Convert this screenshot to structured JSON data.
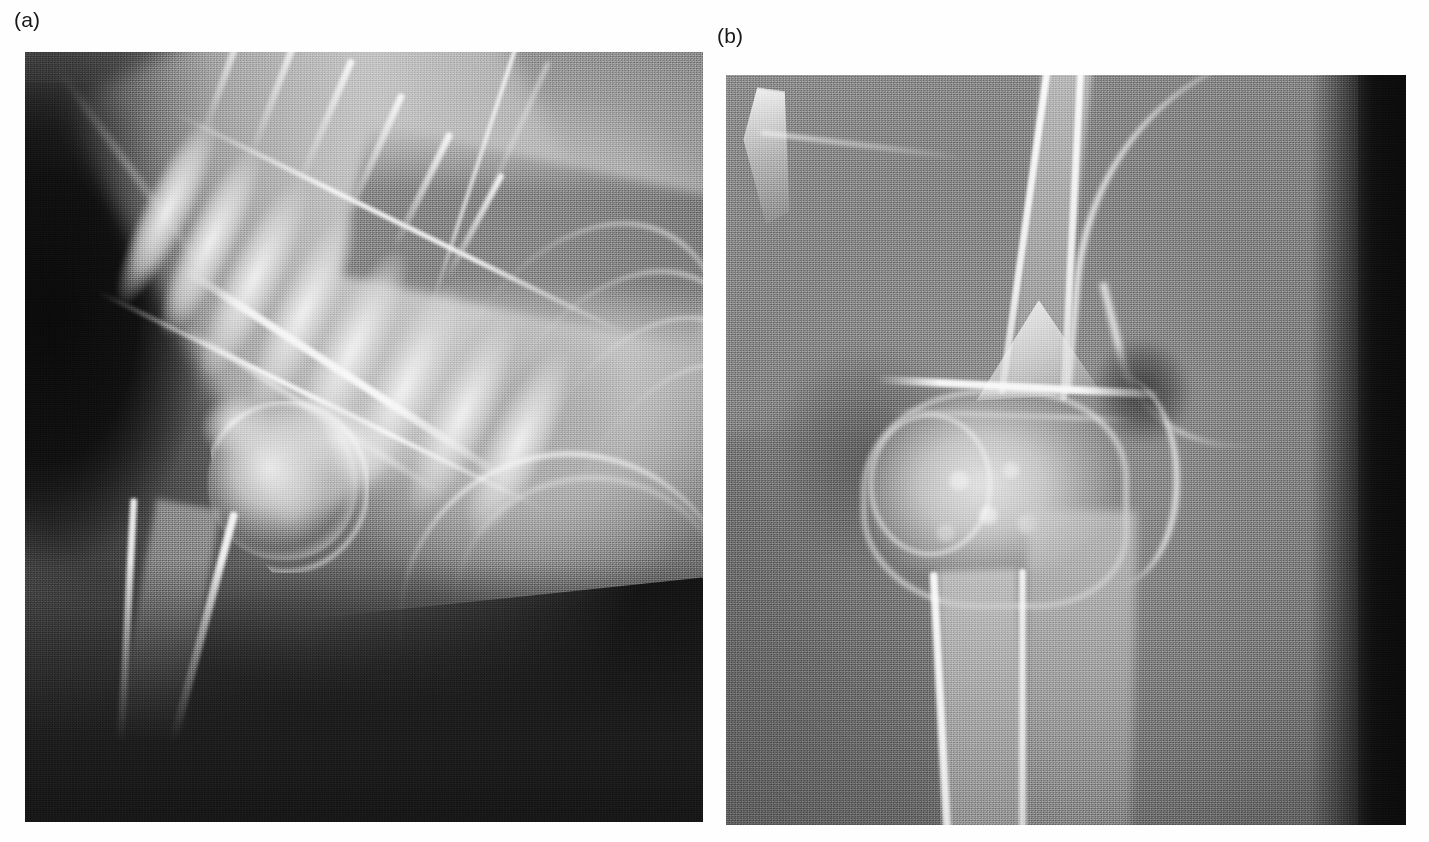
{
  "figure": {
    "background_color": "#fefefe",
    "panel_count": 2,
    "panels": [
      {
        "id": "a",
        "label": "(a)",
        "caption_letter": "a",
        "modality": "radiograph",
        "view": "mediolateral",
        "region": "shoulder",
        "subject": "canine",
        "anatomy_visible": [
          "cervical vertebrae",
          "thoracic vertebrae",
          "spinous processes",
          "scapula",
          "glenoid cavity",
          "humeral head",
          "greater tubercle",
          "humeral shaft",
          "trachea",
          "ribs",
          "sternum"
        ],
        "tone": {
          "background_dark": "#131313",
          "soft_tissue_mid": "#4a4a4a",
          "bone_bright": "#d8d8d8",
          "bone_peak": "#f4f4f4"
        },
        "geometry": {
          "x": 25,
          "y": 52,
          "width": 678,
          "height": 770
        }
      },
      {
        "id": "b",
        "label": "(b)",
        "caption_letter": "b",
        "modality": "radiograph",
        "view": "mediolateral",
        "region": "elbow",
        "subject": "canine",
        "anatomy_visible": [
          "distal humerus",
          "humeral condyle",
          "medial epicondyle",
          "anconeal process",
          "olecranon",
          "olecranon fossa",
          "proximal radius",
          "proximal ulna",
          "radial head",
          "joint space"
        ],
        "tone": {
          "background_dark": "#0f0f0f",
          "soft_tissue_mid": "#808080",
          "bone_bright": "#dcdcdc",
          "bone_peak": "#fafafa"
        },
        "geometry": {
          "x": 726,
          "y": 75,
          "width": 680,
          "height": 750
        }
      }
    ],
    "labels": {
      "panel_a": "(a)",
      "panel_b": "(b)"
    }
  }
}
